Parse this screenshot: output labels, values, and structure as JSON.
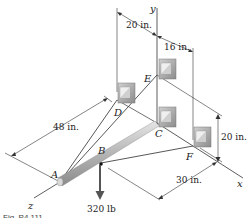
{
  "figure": {
    "caption": "Fig. P4.111",
    "axes": {
      "x": "x",
      "y": "y",
      "z": "z"
    },
    "points": {
      "A": "A",
      "B": "B",
      "C": "C",
      "D": "D",
      "E": "E",
      "F": "F"
    },
    "dimensions": {
      "top_left": "20 in.",
      "top_right": "16 in.",
      "right_vertical": "20 in.",
      "bottom_right": "30 in.",
      "left_diagonal": "48 in."
    },
    "load": {
      "label": "320 lb"
    },
    "colors": {
      "line": "#3a3a3a",
      "rod": "#b8b8b8",
      "bracket": "#9a9a9a",
      "arrow": "#555555"
    }
  }
}
